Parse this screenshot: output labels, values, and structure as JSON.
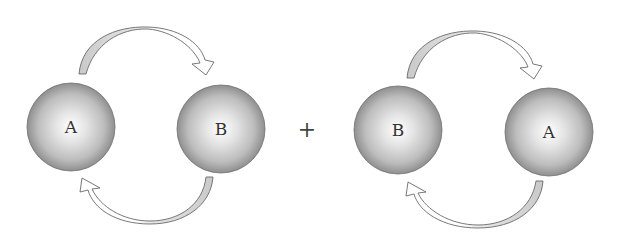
{
  "diagram": {
    "type": "exchange-cycle",
    "left_pair": {
      "sphere_1": {
        "label": "A",
        "cx": 71,
        "cy": 127,
        "r": 44
      },
      "sphere_2": {
        "label": "B",
        "cx": 221,
        "cy": 129,
        "r": 44
      },
      "top_arrow": {
        "from": "A",
        "to": "B",
        "direction": "clockwise-top"
      },
      "bottom_arrow": {
        "from": "B",
        "to": "A",
        "direction": "clockwise-bottom"
      }
    },
    "operator": {
      "symbol": "+",
      "x": 307,
      "y": 130
    },
    "right_pair": {
      "sphere_1": {
        "label": "B",
        "cx": 398,
        "cy": 130,
        "r": 44
      },
      "sphere_2": {
        "label": "A",
        "cx": 549,
        "cy": 132,
        "r": 44
      },
      "top_arrow": {
        "from": "B",
        "to": "A",
        "direction": "clockwise-top"
      },
      "bottom_arrow": {
        "from": "A",
        "to": "B",
        "direction": "clockwise-bottom"
      }
    },
    "colors": {
      "sphere_center": "#ffffff",
      "sphere_edge": "#8f8f8f",
      "sphere_outline": "#6e6e6e",
      "arrow_fill_shaded": "#cfcfcf",
      "arrow_fill_light": "#ffffff",
      "arrow_stroke": "#6a6a6a"
    }
  }
}
